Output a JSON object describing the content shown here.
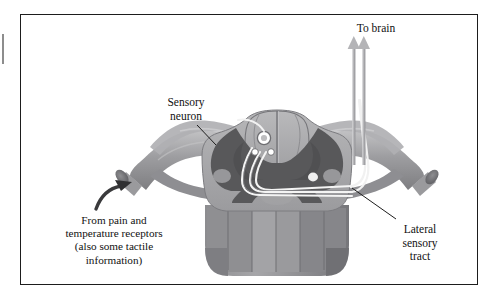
{
  "figure": {
    "title_label": "",
    "background_color": "#ffffff",
    "border_color": "#1d1d1d"
  },
  "labels": {
    "to_brain": "To brain",
    "sensory_neuron": "Sensory\nneuron",
    "from_pain": "From pain and\ntemperature receptors\n(also some tactile\ninformation)",
    "lateral_tract": "Lateral\nsensory\ntract"
  },
  "annotations": {
    "to_brain_arrows": 2,
    "input_arrow": "curved-arrow-pointing-to-cut-nerve",
    "sensory_leader": "line-from-label-to-dorsal-root",
    "lateral_leader": "line-from-label-to-lateral-white-matter"
  },
  "anatomy": {
    "gray_matter_color": "#58585a",
    "white_matter_color": "#a8a8aa",
    "nerve_color": "#9a9a9c",
    "tract_line_color": "#f2f2f2",
    "cell_body_color": "#ffffff",
    "shadow_color": "#7d7d80",
    "parts": [
      "dorsal-columns",
      "dorsal-horn",
      "ventral-horn",
      "central-canal",
      "dorsal-root-ganglion",
      "left-spinal-nerve",
      "right-spinal-nerve",
      "lateral-sensory-tract",
      "decussating-axon"
    ]
  }
}
